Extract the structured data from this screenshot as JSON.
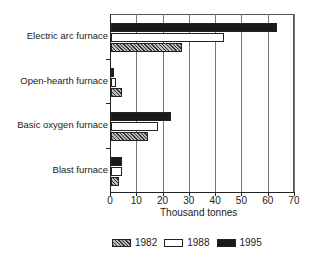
{
  "chart_data": {
    "type": "bar",
    "orientation": "horizontal",
    "title": "",
    "xlabel": "Thousand tonnes",
    "ylabel": "",
    "xlim": [
      0,
      70
    ],
    "xticks": [
      "0",
      "10",
      "20",
      "30",
      "40",
      "50",
      "60",
      "70"
    ],
    "grid": true,
    "legend_position": "bottom",
    "categories": [
      "Electric arc furnace",
      "Open-hearth furnace",
      "Basic oxygen furnace",
      "Blast furnace"
    ],
    "series": [
      {
        "name": "1982",
        "values": [
          27,
          4,
          14,
          3
        ],
        "fill": "hatched"
      },
      {
        "name": "1988",
        "values": [
          43,
          2,
          18,
          4
        ],
        "fill": "white"
      },
      {
        "name": "1995",
        "values": [
          63,
          1,
          23,
          4
        ],
        "fill": "black"
      }
    ]
  },
  "legend": {
    "items": [
      {
        "label": "1982"
      },
      {
        "label": "1988"
      },
      {
        "label": "1995"
      }
    ]
  }
}
